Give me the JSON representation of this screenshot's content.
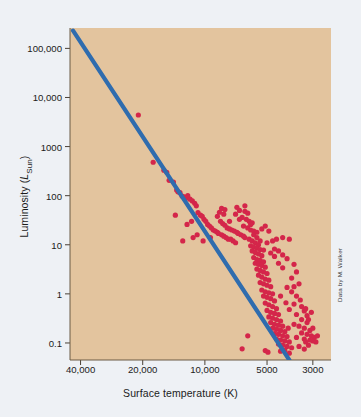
{
  "figure": {
    "background_color": "#eef1f5",
    "plot_background_color": "#e3c49e",
    "credit": "Data by M. Walker"
  },
  "chart_data": {
    "type": "scatter",
    "title": "",
    "xlabel": "Surface temperature (K)",
    "ylabel": "Luminosity (L_Sun)",
    "ylabel_main": "Luminosity (",
    "ylabel_symbol": "L",
    "ylabel_sub": "Sun",
    "ylabel_close": ")",
    "xscale": "log-reversed",
    "yscale": "log",
    "xlim": [
      45000,
      2450
    ],
    "ylim": [
      0.045,
      260000
    ],
    "grid": false,
    "legend": null,
    "xticks": [
      40000,
      20000,
      10000,
      5000,
      3000
    ],
    "xtick_labels": [
      "40,000",
      "20,000",
      "10,000",
      "5000",
      "3000"
    ],
    "yticks": [
      100000,
      10000,
      1000,
      100,
      10,
      1,
      0.1
    ],
    "ytick_labels": [
      "100,000",
      "10,000",
      "1000",
      "100",
      "10",
      "1",
      "0.1"
    ],
    "series": [
      {
        "name": "Main sequence",
        "type": "line",
        "color": "#2f6cae",
        "linewidth": 4.2,
        "points": [
          [
            43500,
            230000
          ],
          [
            3900,
            0.045
          ]
        ]
      },
      {
        "name": "Stars",
        "type": "scatter",
        "color": "#d4264a",
        "marker_size": 2.6,
        "points": [
          [
            21000,
            4400
          ],
          [
            17800,
            480
          ],
          [
            15800,
            330
          ],
          [
            15300,
            300
          ],
          [
            14900,
            205
          ],
          [
            14200,
            190
          ],
          [
            13700,
            130
          ],
          [
            13500,
            120
          ],
          [
            13200,
            115
          ],
          [
            12900,
            98
          ],
          [
            12600,
            95
          ],
          [
            12400,
            88
          ],
          [
            12100,
            100
          ],
          [
            11800,
            85
          ],
          [
            11500,
            78
          ],
          [
            11200,
            70
          ],
          [
            13900,
            40
          ],
          [
            11000,
            62
          ],
          [
            10800,
            45
          ],
          [
            10500,
            40
          ],
          [
            10300,
            38
          ],
          [
            10100,
            33
          ],
          [
            11600,
            30
          ],
          [
            12200,
            26
          ],
          [
            9900,
            30
          ],
          [
            9700,
            26
          ],
          [
            9500,
            24
          ],
          [
            9300,
            22
          ],
          [
            10900,
            16
          ],
          [
            9100,
            20
          ],
          [
            8900,
            19
          ],
          [
            8700,
            18
          ],
          [
            8500,
            46
          ],
          [
            8300,
            55
          ],
          [
            8100,
            42
          ],
          [
            8700,
            38
          ],
          [
            8400,
            30
          ],
          [
            8200,
            27
          ],
          [
            8000,
            25
          ],
          [
            7800,
            22
          ],
          [
            7600,
            21
          ],
          [
            7400,
            20
          ],
          [
            7200,
            19
          ],
          [
            7000,
            18
          ],
          [
            8600,
            17
          ],
          [
            8300,
            16
          ],
          [
            8100,
            15
          ],
          [
            7900,
            14
          ],
          [
            7700,
            13
          ],
          [
            7500,
            13
          ],
          [
            7300,
            12
          ],
          [
            7100,
            11
          ],
          [
            6900,
            17
          ],
          [
            6700,
            16
          ],
          [
            6500,
            15
          ],
          [
            7000,
            58
          ],
          [
            6800,
            50
          ],
          [
            6400,
            48
          ],
          [
            6200,
            44
          ],
          [
            6600,
            36
          ],
          [
            6300,
            33
          ],
          [
            6100,
            30
          ],
          [
            5900,
            28
          ],
          [
            6500,
            24
          ],
          [
            6200,
            22
          ],
          [
            6000,
            20
          ],
          [
            5800,
            19
          ],
          [
            5600,
            18
          ],
          [
            6400,
            14
          ],
          [
            6100,
            13
          ],
          [
            5900,
            12
          ],
          [
            5700,
            11
          ],
          [
            5500,
            10
          ],
          [
            6000,
            9.5
          ],
          [
            5800,
            9
          ],
          [
            5600,
            8.5
          ],
          [
            5400,
            8
          ],
          [
            5900,
            7.5
          ],
          [
            5700,
            7
          ],
          [
            5500,
            6.5
          ],
          [
            5300,
            6
          ],
          [
            5800,
            5.5
          ],
          [
            5600,
            5
          ],
          [
            5400,
            4.8
          ],
          [
            5200,
            4.5
          ],
          [
            5700,
            4.2
          ],
          [
            5500,
            4
          ],
          [
            5300,
            3.8
          ],
          [
            5100,
            3.5
          ],
          [
            5600,
            3.2
          ],
          [
            5400,
            3
          ],
          [
            5200,
            2.8
          ],
          [
            5000,
            2.6
          ],
          [
            5500,
            2.4
          ],
          [
            5300,
            2.2
          ],
          [
            5100,
            2
          ],
          [
            4900,
            1.9
          ],
          [
            5400,
            1.7
          ],
          [
            5200,
            1.6
          ],
          [
            5000,
            1.5
          ],
          [
            4800,
            1.4
          ],
          [
            5300,
            1.2
          ],
          [
            5100,
            1.1
          ],
          [
            4900,
            1.05
          ],
          [
            4700,
            1
          ],
          [
            5200,
            0.9
          ],
          [
            5000,
            0.85
          ],
          [
            4800,
            0.8
          ],
          [
            4600,
            0.72
          ],
          [
            5100,
            0.65
          ],
          [
            4900,
            0.6
          ],
          [
            4700,
            0.55
          ],
          [
            4500,
            0.5
          ],
          [
            5000,
            0.46
          ],
          [
            4800,
            0.42
          ],
          [
            4600,
            0.4
          ],
          [
            4400,
            0.38
          ],
          [
            4900,
            0.34
          ],
          [
            4700,
            0.32
          ],
          [
            4500,
            0.3
          ],
          [
            4300,
            0.28
          ],
          [
            4800,
            0.26
          ],
          [
            4600,
            0.24
          ],
          [
            4400,
            0.23
          ],
          [
            4200,
            0.22
          ],
          [
            4700,
            0.2
          ],
          [
            4500,
            0.19
          ],
          [
            4300,
            0.18
          ],
          [
            4100,
            0.17
          ],
          [
            4600,
            0.155
          ],
          [
            4400,
            0.15
          ],
          [
            4200,
            0.14
          ],
          [
            4000,
            0.135
          ],
          [
            4500,
            0.12
          ],
          [
            4300,
            0.115
          ],
          [
            4100,
            0.11
          ],
          [
            3900,
            0.105
          ],
          [
            4400,
            0.095
          ],
          [
            4200,
            0.09
          ],
          [
            4000,
            0.085
          ],
          [
            3800,
            0.08
          ],
          [
            6200,
            0.14
          ],
          [
            6600,
            0.076
          ],
          [
            4200,
            14
          ],
          [
            3900,
            13
          ],
          [
            3700,
            4
          ],
          [
            3600,
            2.8
          ],
          [
            3500,
            1.6
          ],
          [
            3800,
            1.1
          ],
          [
            3600,
            0.9
          ],
          [
            3400,
            0.55
          ],
          [
            3300,
            0.45
          ],
          [
            3600,
            0.38
          ],
          [
            3400,
            0.3
          ],
          [
            3200,
            0.26
          ],
          [
            3500,
            0.22
          ],
          [
            3300,
            0.2
          ],
          [
            3100,
            0.18
          ],
          [
            3400,
            0.16
          ],
          [
            3200,
            0.15
          ],
          [
            3050,
            0.14
          ],
          [
            3600,
            0.13
          ],
          [
            3300,
            0.12
          ],
          [
            3100,
            0.115
          ],
          [
            2950,
            0.13
          ],
          [
            3000,
            0.2
          ],
          [
            3150,
            0.3
          ],
          [
            3250,
            0.5
          ],
          [
            3450,
            0.75
          ],
          [
            3700,
            0.62
          ],
          [
            3900,
            0.48
          ],
          [
            4050,
            0.66
          ],
          [
            4300,
            0.9
          ],
          [
            3800,
            2.1
          ],
          [
            4000,
            1.35
          ],
          [
            3700,
            1.4
          ],
          [
            4500,
            13
          ],
          [
            4700,
            12
          ],
          [
            4900,
            19
          ],
          [
            5100,
            24
          ],
          [
            5300,
            21
          ],
          [
            4600,
            8.2
          ],
          [
            4400,
            7.5
          ],
          [
            4200,
            6.2
          ],
          [
            4000,
            5.2
          ],
          [
            5000,
            11
          ],
          [
            4800,
            6.8
          ],
          [
            4600,
            5.8
          ],
          [
            4400,
            4.2
          ],
          [
            4200,
            3.4
          ],
          [
            5200,
            7.8
          ],
          [
            5400,
            12
          ],
          [
            5600,
            14
          ],
          [
            5800,
            16
          ],
          [
            6000,
            26
          ],
          [
            6400,
            62
          ],
          [
            6800,
            33
          ],
          [
            7100,
            42
          ],
          [
            7600,
            30
          ],
          [
            8000,
            52
          ],
          [
            9400,
            14
          ],
          [
            10200,
            12
          ],
          [
            11400,
            14
          ],
          [
            12800,
            12
          ],
          [
            3300,
            0.075
          ],
          [
            3500,
            0.085
          ],
          [
            3150,
            0.09
          ],
          [
            4100,
            0.072
          ],
          [
            4300,
            0.068
          ],
          [
            3900,
            0.062
          ],
          [
            5100,
            0.07
          ],
          [
            4950,
            0.065
          ],
          [
            3250,
            0.105
          ],
          [
            3000,
            0.11
          ],
          [
            2900,
            0.105
          ],
          [
            2850,
            0.14
          ],
          [
            3050,
            0.42
          ],
          [
            3200,
            0.36
          ],
          [
            3700,
            0.24
          ],
          [
            3950,
            0.2
          ]
        ]
      }
    ]
  }
}
